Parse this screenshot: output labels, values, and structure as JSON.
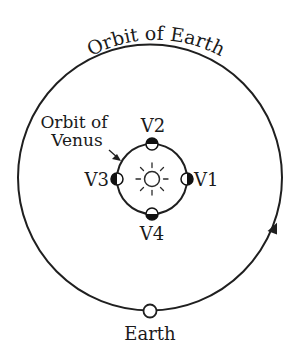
{
  "diagram": {
    "title": "Orbit of Earth",
    "earth_orbit_label": "Orbit of Earth",
    "venus_orbit_label_line1": "Orbit of",
    "venus_orbit_label_line2": "Venus",
    "earth_label": "Earth",
    "sun_icon": "sun-icon",
    "venus_positions": [
      {
        "label": "V1",
        "position": "right",
        "lit_side": "left"
      },
      {
        "label": "V2",
        "position": "top",
        "lit_side": "bottom"
      },
      {
        "label": "V3",
        "position": "left",
        "lit_side": "right"
      },
      {
        "label": "V4",
        "position": "bottom",
        "lit_side": "top"
      }
    ],
    "earth_orbit_direction": "counterclockwise",
    "colors": {
      "line": "#1f1f1f",
      "background": "#ffffff",
      "shadow": "#111111"
    }
  }
}
